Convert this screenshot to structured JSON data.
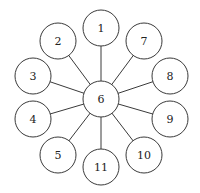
{
  "diagram": {
    "type": "star-graph",
    "center": {
      "id": "6",
      "label": "6",
      "x": 101,
      "y": 99,
      "r": 18
    },
    "nodes": [
      {
        "id": "1",
        "label": "1",
        "x": 101,
        "y": 28,
        "r": 18
      },
      {
        "id": "2",
        "label": "2",
        "x": 58,
        "y": 41,
        "r": 18
      },
      {
        "id": "3",
        "label": "3",
        "x": 33,
        "y": 76,
        "r": 18
      },
      {
        "id": "4",
        "label": "4",
        "x": 33,
        "y": 119,
        "r": 18
      },
      {
        "id": "5",
        "label": "5",
        "x": 58,
        "y": 155,
        "r": 18
      },
      {
        "id": "11",
        "label": "11",
        "x": 101,
        "y": 167,
        "r": 18
      },
      {
        "id": "10",
        "label": "10",
        "x": 144,
        "y": 155,
        "r": 18
      },
      {
        "id": "9",
        "label": "9",
        "x": 170,
        "y": 119,
        "r": 18
      },
      {
        "id": "8",
        "label": "8",
        "x": 170,
        "y": 76,
        "r": 18
      },
      {
        "id": "7",
        "label": "7",
        "x": 144,
        "y": 41,
        "r": 18
      }
    ],
    "edges": [
      [
        "6",
        "1"
      ],
      [
        "6",
        "2"
      ],
      [
        "6",
        "3"
      ],
      [
        "6",
        "4"
      ],
      [
        "6",
        "5"
      ],
      [
        "6",
        "11"
      ],
      [
        "6",
        "10"
      ],
      [
        "6",
        "9"
      ],
      [
        "6",
        "8"
      ],
      [
        "6",
        "7"
      ]
    ],
    "colors": {
      "stroke": "#3a3a3a",
      "fill": "#ffffff",
      "text": "#222222"
    }
  }
}
